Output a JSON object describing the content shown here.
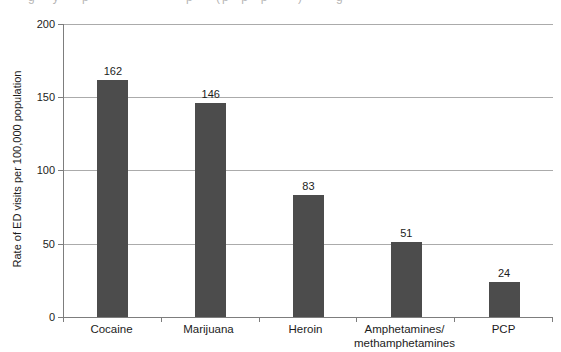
{
  "figure": {
    "background": "#ffffff",
    "caption_remnant": {
      "note": "cut-off text line at top edge, only descenders visible, illegible",
      "color": "#8f8f8f",
      "fragments": [
        {
          "x": 28,
          "text": "g   y    p"
        },
        {
          "x": 186,
          "text": "p    (p  p  p"
        },
        {
          "x": 298,
          "text": ")      g"
        }
      ]
    }
  },
  "chart_data": {
    "type": "bar",
    "title": "",
    "categories": [
      "Cocaine",
      "Marijuana",
      "Heroin",
      "Amphetamines/\nmethamphetamines",
      "PCP"
    ],
    "values": [
      162,
      146,
      83,
      51,
      24
    ],
    "value_labels": [
      "162",
      "146",
      "83",
      "51",
      "24"
    ],
    "xlabel": "",
    "ylabel": "Rate of ED visits per 100,000 population",
    "ylim": [
      0,
      200
    ],
    "yticks": [
      0,
      50,
      100,
      150,
      200
    ],
    "grid": "horizontal gridlines at 50/100/150/200, top line closes plot box",
    "legend": "none",
    "bar_color": "#4c4c4c",
    "gridline_color": "#ababab",
    "axis_color": "#7d7d7d",
    "text_color": "#1c1c1c"
  }
}
